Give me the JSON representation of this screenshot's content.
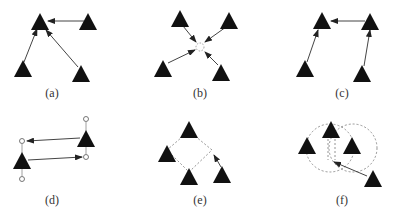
{
  "figure": {
    "panels": [
      {
        "id": "a",
        "label": "(a)",
        "label_x": 52,
        "label_y": 86,
        "description": "Three nodes with arrows pointing to a single leader node"
      },
      {
        "id": "b",
        "label": "(b)",
        "label_x": 200,
        "label_y": 86,
        "description": "Four nodes with arrows converging to a dashed virtual center point"
      },
      {
        "id": "c",
        "label": "(c)",
        "label_x": 342,
        "label_y": 86,
        "description": "Chain of nodes: two pointing up, one pointing left to the leader"
      },
      {
        "id": "d",
        "label": "(d)",
        "label_x": 52,
        "label_y": 193,
        "description": "Two nodes with hollow circle anchor points and crossing arrows"
      },
      {
        "id": "e",
        "label": "(e)",
        "label_x": 200,
        "label_y": 193,
        "description": "Four nodes in dashed diamond formation with one node moving into place"
      },
      {
        "id": "f",
        "label": "(f)",
        "label_x": 342,
        "label_y": 193,
        "description": "Two overlapping dashed circles with nodes, outer node moving to intersection"
      }
    ],
    "colors": {
      "node": "#111111",
      "arrow": "#444444",
      "dashed": "#888888",
      "hollow_circle": "#555555"
    }
  }
}
